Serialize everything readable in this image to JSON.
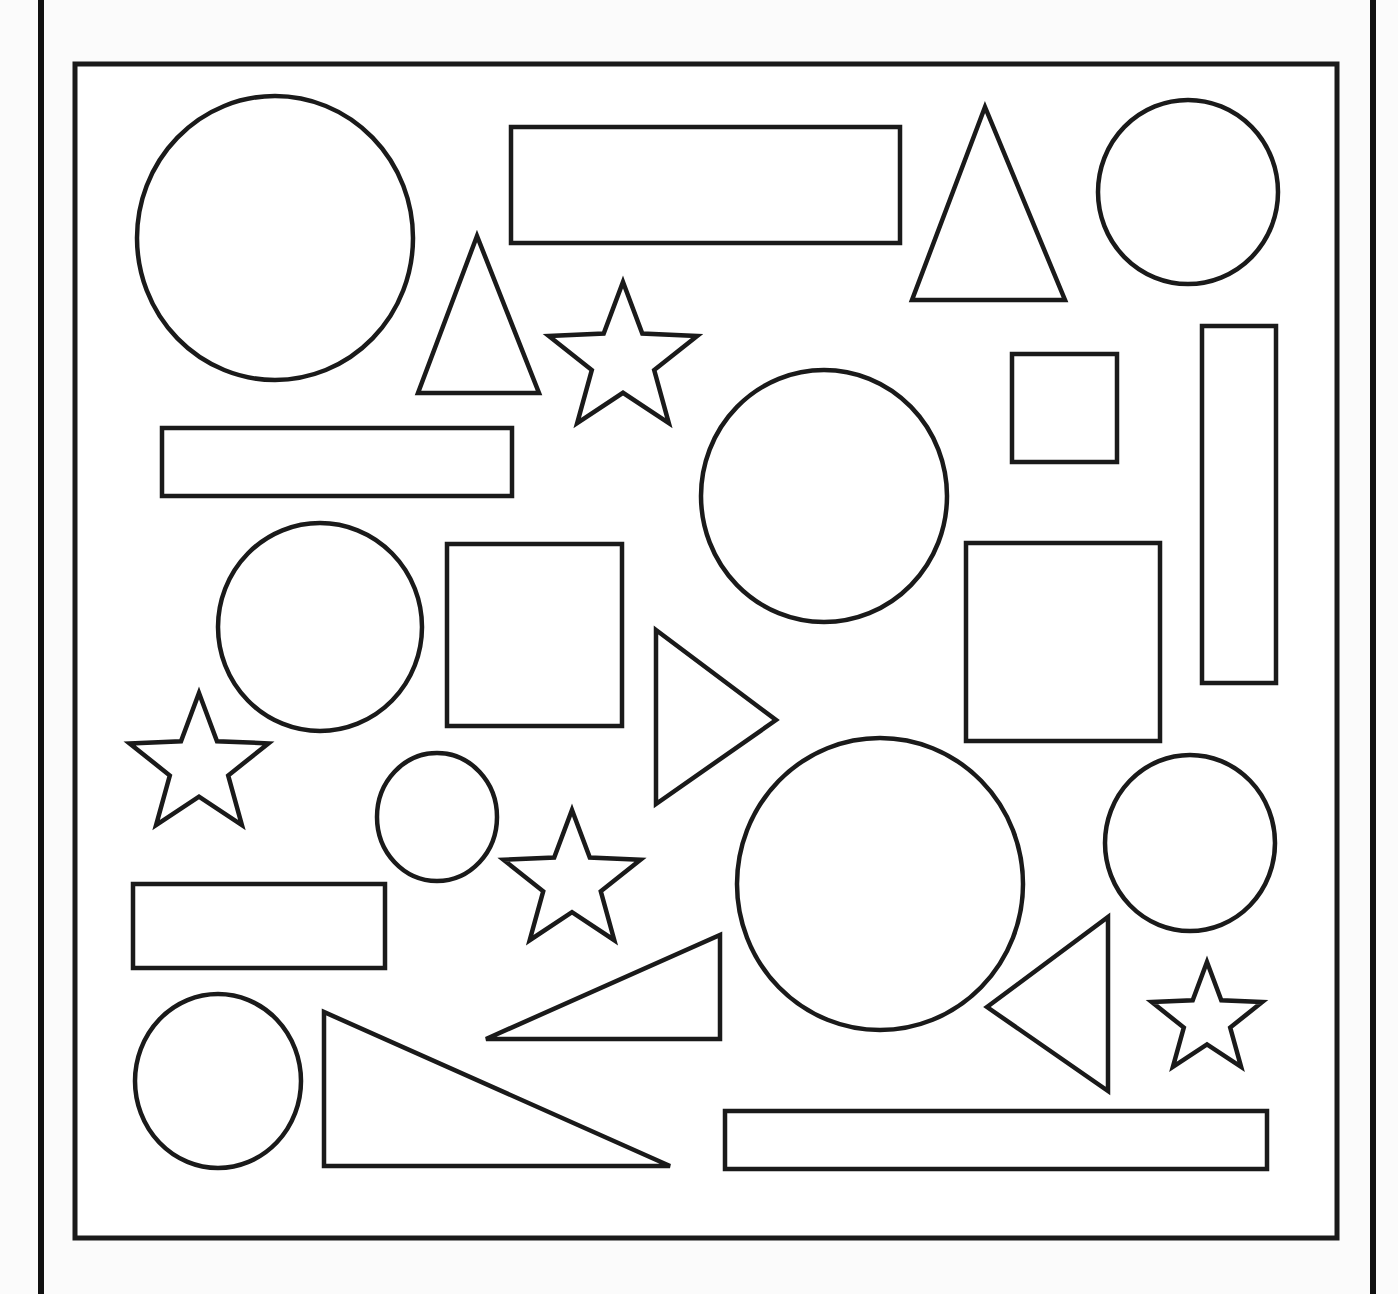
{
  "worksheet": {
    "description": "Shapes worksheet: outlined circles, rectangles, triangles and stars inside a framed box",
    "stroke_color": "#1a1a1a",
    "background_color": "#fbfbfb",
    "frame": {
      "x1": 75,
      "y1": 64,
      "x2": 1337,
      "y2": 1238
    },
    "page_lines": [
      {
        "x": 38
      },
      {
        "x": 1370
      }
    ],
    "counts": {
      "circles": 8,
      "rectangles": 7,
      "triangles": 7,
      "stars": 4
    },
    "shapes": [
      {
        "id": "circle-1",
        "type": "ellipse",
        "cx": 275,
        "cy": 238,
        "rx": 138,
        "ry": 142
      },
      {
        "id": "rect-1",
        "type": "rect",
        "x": 511,
        "y": 127,
        "w": 389,
        "h": 116
      },
      {
        "id": "triangle-1",
        "type": "polygon",
        "points": "985,107 912,300 1065,300"
      },
      {
        "id": "circle-2",
        "type": "ellipse",
        "cx": 1188,
        "cy": 192,
        "rx": 90,
        "ry": 92
      },
      {
        "id": "triangle-2",
        "type": "polygon",
        "points": "477,236 418,393 539,393"
      },
      {
        "id": "star-1",
        "type": "star",
        "cx": 623,
        "cy": 360,
        "r": 78
      },
      {
        "id": "rect-2",
        "type": "rect",
        "x": 1012,
        "y": 354,
        "w": 105,
        "h": 108
      },
      {
        "id": "rect-3",
        "type": "rect",
        "x": 1202,
        "y": 326,
        "w": 74,
        "h": 357
      },
      {
        "id": "rect-4",
        "type": "rect",
        "x": 162,
        "y": 428,
        "w": 350,
        "h": 68
      },
      {
        "id": "circle-3",
        "type": "ellipse",
        "cx": 824,
        "cy": 496,
        "rx": 123,
        "ry": 126
      },
      {
        "id": "circle-4",
        "type": "ellipse",
        "cx": 320,
        "cy": 627,
        "rx": 102,
        "ry": 104
      },
      {
        "id": "rect-5",
        "type": "rect",
        "x": 447,
        "y": 544,
        "w": 175,
        "h": 182
      },
      {
        "id": "triangle-3",
        "type": "polygon",
        "points": "656,630 776,720 656,804"
      },
      {
        "id": "rect-6",
        "type": "rect",
        "x": 966,
        "y": 543,
        "w": 194,
        "h": 198
      },
      {
        "id": "star-2",
        "type": "star",
        "cx": 199,
        "cy": 766,
        "r": 73
      },
      {
        "id": "circle-5",
        "type": "ellipse",
        "cx": 437,
        "cy": 817,
        "rx": 60,
        "ry": 64
      },
      {
        "id": "star-3",
        "type": "star",
        "cx": 572,
        "cy": 882,
        "r": 72
      },
      {
        "id": "circle-6",
        "type": "ellipse",
        "cx": 880,
        "cy": 884,
        "rx": 143,
        "ry": 146
      },
      {
        "id": "circle-7",
        "type": "ellipse",
        "cx": 1190,
        "cy": 843,
        "rx": 85,
        "ry": 88
      },
      {
        "id": "rect-7",
        "type": "rect",
        "x": 133,
        "y": 884,
        "w": 252,
        "h": 84
      },
      {
        "id": "triangle-4",
        "type": "polygon",
        "points": "486,1039 720,935 720,1039"
      },
      {
        "id": "triangle-5",
        "type": "polygon",
        "points": "987,1007 1108,917 1108,1091"
      },
      {
        "id": "star-4",
        "type": "star",
        "cx": 1207,
        "cy": 1020,
        "r": 58
      },
      {
        "id": "circle-8",
        "type": "ellipse",
        "cx": 218,
        "cy": 1081,
        "rx": 83,
        "ry": 87
      },
      {
        "id": "triangle-6",
        "type": "polygon",
        "points": "324,1012 324,1166 670,1166"
      },
      {
        "id": "rect-8",
        "type": "rect",
        "x": 725,
        "y": 1111,
        "w": 542,
        "h": 58
      }
    ]
  }
}
